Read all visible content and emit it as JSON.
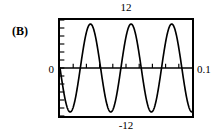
{
  "figure": {
    "panel_label": "(B)",
    "background_color": "#ffffff",
    "frame_color": "#000000",
    "curve_color": "#000000"
  },
  "chart_data": {
    "type": "line",
    "title": "",
    "subtitle": "",
    "panel": "(B)",
    "xlabel": "",
    "ylabel": "",
    "xlim": [
      0,
      0.1
    ],
    "ylim": [
      -12,
      12
    ],
    "xtick_labels": [
      "0",
      "0.1"
    ],
    "ytick_labels": [
      "12",
      "-12"
    ],
    "axis_labels": {
      "top": "12",
      "bottom": "-12",
      "left": "0",
      "right": "0.1"
    },
    "grid": false,
    "legend": null,
    "zero_axis_line": true,
    "tick_marks_inside": true,
    "annotations": [],
    "series": [
      {
        "name": "waveform",
        "description": "negative-going sinusoid, amplitude 11, about 3.25 cycles across 0 to 0.1 s",
        "amplitude": 11,
        "cycles": 3.25,
        "phase": "starts at zero descending",
        "x": [
          0,
          0.0038,
          0.0077,
          0.0115,
          0.0154,
          0.0192,
          0.0231,
          0.0269,
          0.0308,
          0.0346,
          0.0385,
          0.0423,
          0.0462,
          0.05,
          0.0538,
          0.0577,
          0.0615,
          0.0654,
          0.0692,
          0.0731,
          0.0769,
          0.0808,
          0.0846,
          0.0885,
          0.0923,
          0.0962,
          0.1
        ],
        "y": [
          0,
          -8.6,
          -11,
          -6.5,
          0,
          6.5,
          11,
          8.6,
          0,
          -8.6,
          -11,
          -6.5,
          0,
          6.5,
          11,
          8.6,
          0,
          -8.6,
          -11,
          -6.5,
          0,
          6.5,
          11,
          8.6,
          0,
          -8.6,
          -11
        ],
        "peaks_x": [
          0.0231,
          0.0538,
          0.0846
        ],
        "peaks_y": [
          11,
          11,
          11
        ],
        "troughs_x": [
          0.0077,
          0.0385,
          0.0692,
          0.1
        ],
        "troughs_y": [
          -11,
          -11,
          -11,
          -11
        ]
      }
    ]
  }
}
